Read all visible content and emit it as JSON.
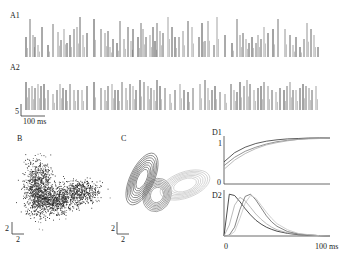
{
  "figure": {
    "panels": {
      "A1": {
        "label": "A1"
      },
      "A2": {
        "label": "A2",
        "scale_y": "5",
        "scale_x": "100 ms"
      },
      "B": {
        "label": "B",
        "scale_y": "2",
        "scale_x": "2"
      },
      "C": {
        "label": "C",
        "scale_y": "2",
        "scale_x": "2"
      },
      "D1": {
        "label": "D1",
        "y_top": "1",
        "y_bottom": "0"
      },
      "D2": {
        "label": "D2",
        "x_left": "0",
        "x_right": "100 ms"
      }
    }
  },
  "chart_data": [
    {
      "panel": "A1",
      "type": "bar",
      "title": "A1",
      "description": "Spike-amplitude raster (vertical lines), ~4 bursts across the recording",
      "xlabel": "",
      "ylabel": "",
      "x": [
        26,
        30,
        33,
        35,
        38,
        42,
        48,
        53,
        58,
        61,
        64,
        67,
        70,
        74,
        77,
        80,
        83,
        87,
        94,
        101,
        105,
        108,
        110,
        113,
        117,
        120,
        124,
        128,
        131,
        133,
        138,
        141,
        143,
        146,
        150,
        153,
        155,
        157,
        160,
        163,
        168,
        172,
        175,
        179,
        183,
        188,
        192,
        199,
        202,
        205,
        208,
        214,
        217,
        225,
        232,
        237,
        240,
        243,
        246,
        249,
        252,
        256,
        258,
        261,
        264,
        268,
        273,
        278,
        285,
        290,
        293,
        296,
        300,
        304,
        307,
        311,
        314,
        318
      ],
      "values": [
        20,
        38,
        22,
        20,
        12,
        30,
        12,
        33,
        25,
        17,
        28,
        14,
        22,
        28,
        30,
        40,
        22,
        24,
        38,
        28,
        24,
        26,
        10,
        18,
        14,
        36,
        18,
        30,
        16,
        28,
        20,
        34,
        28,
        20,
        22,
        30,
        16,
        34,
        26,
        24,
        40,
        30,
        20,
        20,
        26,
        36,
        30,
        20,
        34,
        16,
        36,
        12,
        40,
        22,
        14,
        38,
        22,
        24,
        18,
        14,
        20,
        14,
        22,
        18,
        30,
        24,
        28,
        38,
        28,
        22,
        12,
        20,
        10,
        18,
        34,
        28,
        22,
        10
      ]
    },
    {
      "panel": "A2",
      "type": "bar",
      "title": "A2",
      "description": "Spike-amplitude raster (vertical lines)",
      "scale_bar": {
        "y": 5,
        "x_ms": 100
      },
      "x": [
        26,
        29,
        32,
        35,
        38,
        41,
        44,
        48,
        53,
        57,
        60,
        63,
        66,
        70,
        74,
        78,
        82,
        87,
        94,
        101,
        105,
        108,
        112,
        115,
        118,
        122,
        126,
        130,
        133,
        136,
        140,
        144,
        148,
        151,
        154,
        157,
        160,
        165,
        170,
        175,
        180,
        184,
        188,
        193,
        200,
        205,
        208,
        212,
        215,
        220,
        225,
        231,
        234,
        237,
        240,
        244,
        247,
        250,
        254,
        258,
        261,
        264,
        268,
        272,
        276,
        280,
        284,
        287,
        290,
        293,
        296,
        300,
        303,
        306,
        309,
        312,
        316
      ],
      "values": [
        28,
        22,
        24,
        22,
        26,
        24,
        26,
        20,
        16,
        20,
        26,
        22,
        20,
        26,
        20,
        20,
        20,
        24,
        28,
        22,
        20,
        24,
        26,
        20,
        20,
        28,
        22,
        26,
        24,
        20,
        30,
        28,
        24,
        22,
        20,
        30,
        24,
        22,
        16,
        20,
        26,
        20,
        18,
        22,
        26,
        30,
        22,
        20,
        24,
        18,
        16,
        26,
        20,
        18,
        28,
        24,
        30,
        26,
        20,
        22,
        24,
        28,
        24,
        20,
        18,
        22,
        20,
        24,
        28,
        20,
        20,
        22,
        26,
        24,
        22,
        20,
        24
      ]
    },
    {
      "panel": "B",
      "type": "scatter",
      "title": "B",
      "description": "Dense 2D scatter forming a curved (boomerang) cluster; dense lobe left, tail extends right",
      "scale_bar": {
        "x": 2,
        "y": 2
      },
      "clusters": [
        {
          "center": [
            38,
            188
          ],
          "spread": [
            10,
            20
          ],
          "n": 900
        },
        {
          "center": [
            55,
            200
          ],
          "spread": [
            14,
            10
          ],
          "n": 700
        },
        {
          "center": [
            80,
            192
          ],
          "spread": [
            14,
            9
          ],
          "n": 500
        }
      ]
    },
    {
      "panel": "C",
      "type": "line",
      "title": "C",
      "description": "Contour ellipses of three fitted Gaussian clusters",
      "scale_bar": {
        "x": 2,
        "y": 2
      },
      "ellipses": [
        {
          "cx": 142,
          "cy": 179,
          "rx": 12,
          "ry": 28,
          "rotate": 25,
          "color": "#555555",
          "rings": 8
        },
        {
          "cx": 157,
          "cy": 195,
          "rx": 14,
          "ry": 17,
          "rotate": 20,
          "color": "#777777",
          "rings": 7
        },
        {
          "cx": 185,
          "cy": 185,
          "rx": 26,
          "ry": 13,
          "rotate": -20,
          "color": "#c0c0c0",
          "rings": 7
        }
      ]
    },
    {
      "panel": "D1",
      "type": "line",
      "title": "D1",
      "description": "Saturating recovery curves rising from ~0.35-0.5 to 1",
      "ylim": [
        0,
        1
      ],
      "yticks": [
        "0",
        "1"
      ],
      "x": [
        0,
        10,
        20,
        30,
        40,
        50,
        60,
        70,
        80,
        90,
        100
      ],
      "series": [
        {
          "name": "curve1",
          "color": "#333333",
          "values": [
            0.48,
            0.68,
            0.8,
            0.88,
            0.93,
            0.96,
            0.98,
            0.99,
            1.0,
            1.0,
            1.0
          ]
        },
        {
          "name": "curve2",
          "color": "#777777",
          "values": [
            0.4,
            0.58,
            0.71,
            0.8,
            0.87,
            0.92,
            0.95,
            0.97,
            0.99,
            1.0,
            1.0
          ]
        },
        {
          "name": "curve3",
          "color": "#aaaaaa",
          "values": [
            0.32,
            0.52,
            0.66,
            0.77,
            0.85,
            0.9,
            0.94,
            0.97,
            0.98,
            0.99,
            1.0
          ]
        }
      ]
    },
    {
      "panel": "D2",
      "type": "line",
      "title": "D2",
      "description": "Interval/latency distributions with peaks at increasing delays",
      "xlabel": "ms",
      "xticks": [
        "0",
        "100 ms"
      ],
      "xlim": [
        0,
        100
      ],
      "x": [
        0,
        5,
        10,
        15,
        20,
        25,
        30,
        35,
        40,
        45,
        50,
        60,
        70,
        80,
        90,
        100
      ],
      "series": [
        {
          "name": "dist1",
          "color": "#222222",
          "values": [
            0,
            0.95,
            0.92,
            0.78,
            0.62,
            0.48,
            0.36,
            0.27,
            0.2,
            0.15,
            0.11,
            0.06,
            0.03,
            0.02,
            0.01,
            0.0
          ]
        },
        {
          "name": "dist2",
          "color": "#aaaaaa",
          "values": [
            0,
            0.25,
            0.7,
            0.88,
            0.8,
            0.65,
            0.5,
            0.38,
            0.28,
            0.2,
            0.14,
            0.07,
            0.04,
            0.02,
            0.01,
            0.0
          ]
        },
        {
          "name": "dist3",
          "color": "#666666",
          "values": [
            0,
            0.02,
            0.2,
            0.6,
            0.9,
            0.95,
            0.82,
            0.64,
            0.46,
            0.32,
            0.22,
            0.1,
            0.05,
            0.02,
            0.01,
            0.0
          ]
        },
        {
          "name": "dist4",
          "color": "#c4c4c4",
          "values": [
            0,
            0.01,
            0.1,
            0.4,
            0.75,
            0.92,
            0.86,
            0.7,
            0.54,
            0.4,
            0.28,
            0.14,
            0.06,
            0.03,
            0.01,
            0.0
          ]
        }
      ]
    }
  ]
}
